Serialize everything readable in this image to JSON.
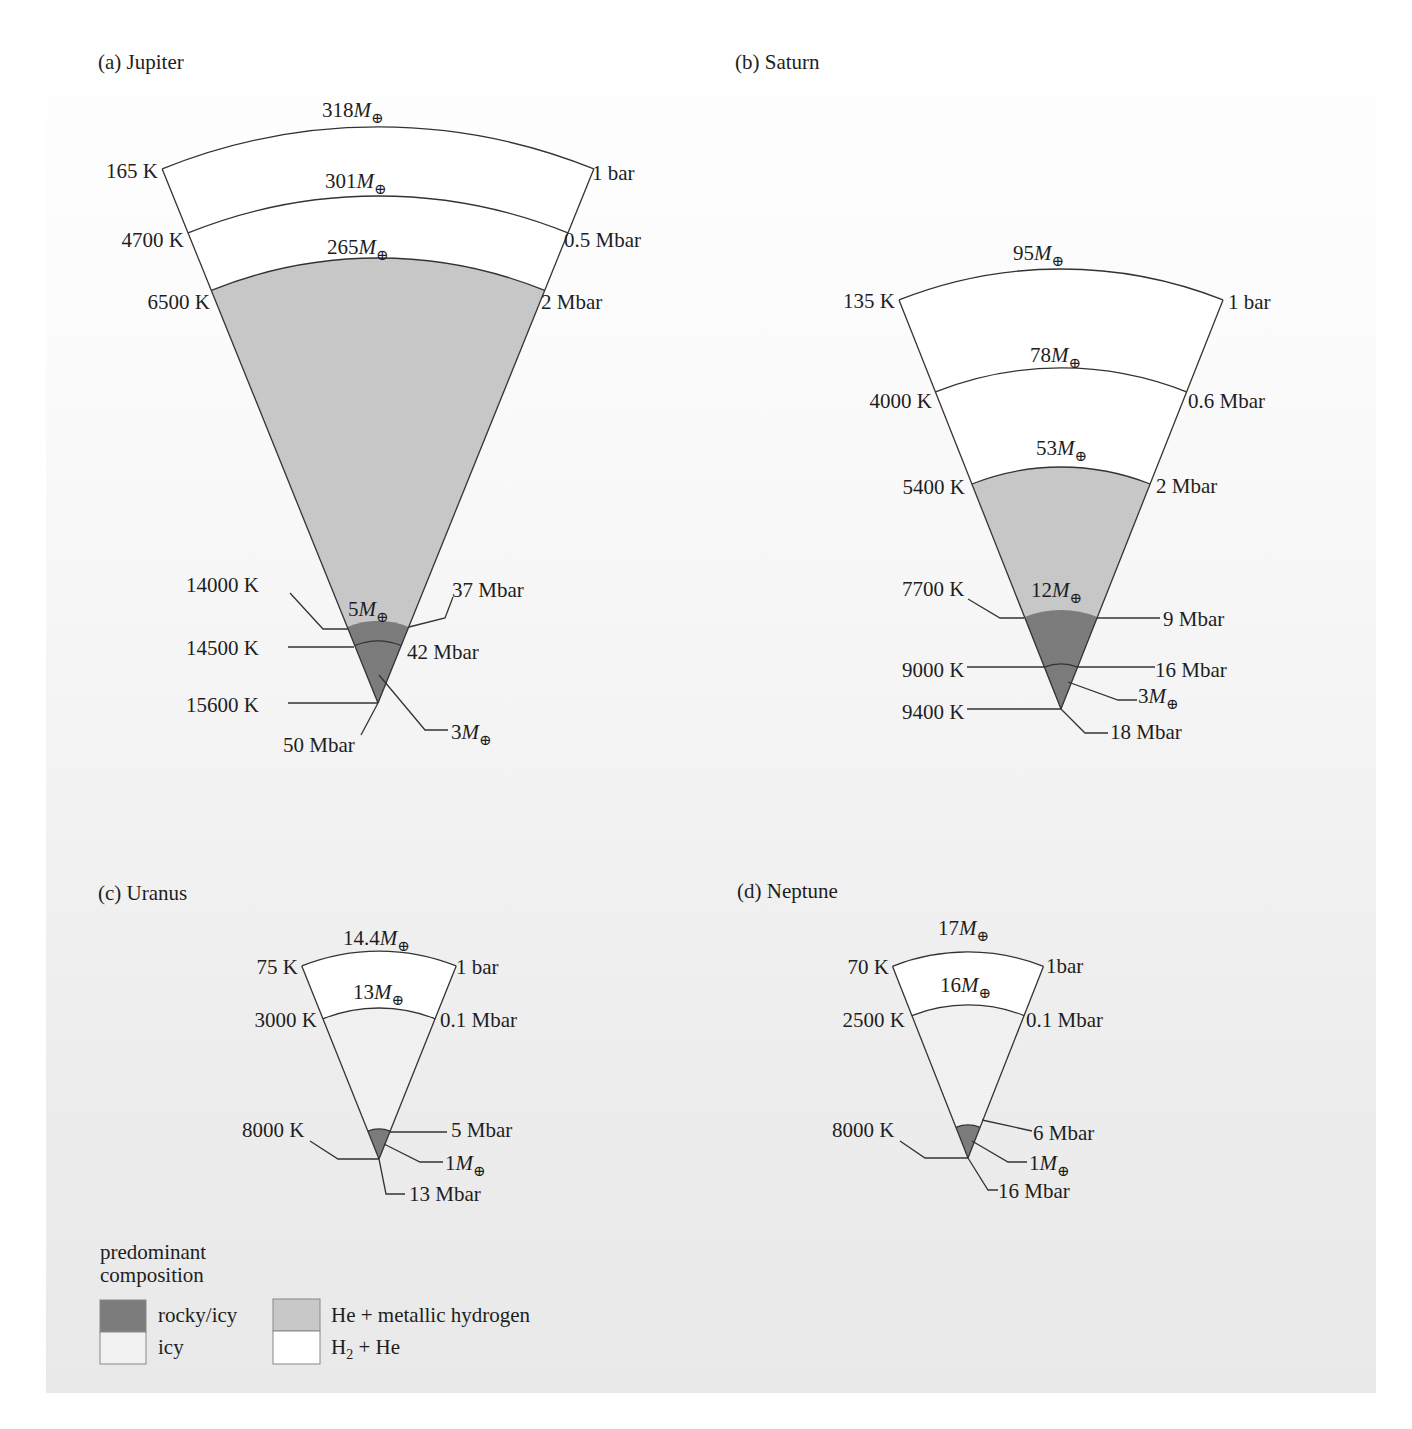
{
  "colors": {
    "rocky_icy": "#7c7c7c",
    "icy": "#f2f2f2",
    "he_metallic_h": "#c8c8c8",
    "h2_he": "#ffffff",
    "stroke": "#333333"
  },
  "planets": [
    {
      "id": "jupiter",
      "title": "(a) Jupiter",
      "layers": [
        {
          "composition": "h2_he",
          "outer_mass": "318",
          "left_label": "165 K",
          "right_label": "1 bar"
        },
        {
          "composition": "h2_he",
          "outer_mass": "301",
          "left_label": "4700 K",
          "right_label": "0.5 Mbar"
        },
        {
          "composition": "he_metallic_h",
          "outer_mass": "265",
          "left_label": "6500 K",
          "right_label": "2 Mbar"
        },
        {
          "composition": "rocky_icy",
          "outer_mass": "5",
          "left_label": "14000 K",
          "right_label": "37 Mbar"
        },
        {
          "composition": "rocky_icy",
          "outer_mass": "3",
          "left_label": "14500 K",
          "right_label": "42 Mbar"
        }
      ],
      "center": {
        "left_label": "15600 K",
        "right_label": "50 Mbar"
      }
    },
    {
      "id": "saturn",
      "title": "(b) Saturn",
      "layers": [
        {
          "composition": "h2_he",
          "outer_mass": "95",
          "left_label": "135 K",
          "right_label": "1 bar"
        },
        {
          "composition": "h2_he",
          "outer_mass": "78",
          "left_label": "4000 K",
          "right_label": "0.6 Mbar"
        },
        {
          "composition": "he_metallic_h",
          "outer_mass": "53",
          "left_label": "5400 K",
          "right_label": "2 Mbar"
        },
        {
          "composition": "rocky_icy",
          "outer_mass": "12",
          "left_label": "7700 K",
          "right_label": "9 Mbar"
        },
        {
          "composition": "rocky_icy",
          "outer_mass": "3",
          "left_label": "9000 K",
          "right_label": "16 Mbar"
        }
      ],
      "center": {
        "left_label": "9400 K",
        "right_label": "18 Mbar"
      }
    },
    {
      "id": "uranus",
      "title": "(c) Uranus",
      "layers": [
        {
          "composition": "h2_he",
          "outer_mass": "14.4",
          "left_label": "75 K",
          "right_label": "1 bar"
        },
        {
          "composition": "icy",
          "outer_mass": "13",
          "left_label": "3000 K",
          "right_label": "0.1 Mbar"
        },
        {
          "composition": "rocky_icy",
          "outer_mass": "1",
          "left_label": "8000 K",
          "right_label": "5 Mbar"
        }
      ],
      "center": {
        "left_label": "",
        "right_label": "13 Mbar"
      }
    },
    {
      "id": "neptune",
      "title": "(d) Neptune",
      "layers": [
        {
          "composition": "h2_he",
          "outer_mass": "17",
          "left_label": "70 K",
          "right_label": "1bar"
        },
        {
          "composition": "icy",
          "outer_mass": "16",
          "left_label": "2500 K",
          "right_label": "0.1 Mbar"
        },
        {
          "composition": "rocky_icy",
          "outer_mass": "1",
          "left_label": "8000 K",
          "right_label": "6 Mbar"
        }
      ],
      "center": {
        "left_label": "",
        "right_label": "16 Mbar"
      }
    }
  ],
  "mass_unit": "M",
  "mass_unit_subscript": "⊕",
  "legend": {
    "title_line1": "predominant",
    "title_line2": "composition",
    "items": [
      {
        "key": "rocky_icy",
        "label": "rocky/icy"
      },
      {
        "key": "icy",
        "label": "icy"
      },
      {
        "key": "he_metallic_h",
        "label": "He + metallic hydrogen"
      },
      {
        "key": "h2_he",
        "label_main": "H",
        "label_sub": "2",
        "label_rest": " + He"
      }
    ]
  }
}
